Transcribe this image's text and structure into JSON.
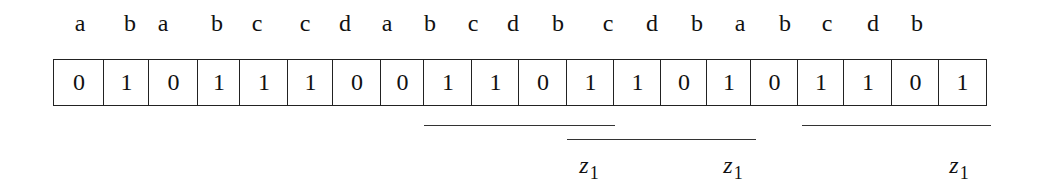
{
  "diagram": {
    "symbols": [
      "a",
      "b",
      "a",
      "b",
      "c",
      "c",
      "d",
      "a",
      "b",
      "c",
      "d",
      "b",
      "c",
      "d",
      "b",
      "a",
      "b",
      "c",
      "d",
      "b"
    ],
    "bits": [
      "0",
      "1",
      "0",
      "1",
      "1",
      "1",
      "0",
      "0",
      "1",
      "1",
      "0",
      "1",
      "1",
      "0",
      "1",
      "0",
      "1",
      "1",
      "0",
      "1"
    ],
    "segments": [
      {
        "name": "segment-1",
        "label_base": "z",
        "label_sub": "1"
      },
      {
        "name": "segment-2",
        "label_base": "z",
        "label_sub": "1"
      },
      {
        "name": "segment-3",
        "label_base": "z",
        "label_sub": "1"
      }
    ]
  }
}
